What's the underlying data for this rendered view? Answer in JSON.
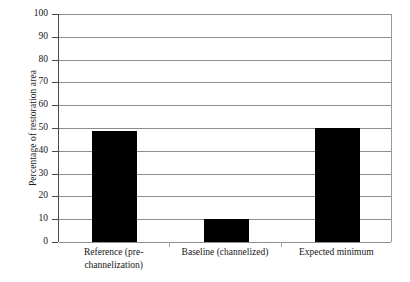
{
  "chart_data": {
    "type": "bar",
    "title": "",
    "xlabel": "",
    "ylabel": "Percentage of restoration area",
    "categories": [
      "Reference (pre-channelization)",
      "Baseline (channelized)",
      "Expected minimum"
    ],
    "category_lines": [
      [
        "Reference (pre-",
        "channelization)"
      ],
      [
        "Baseline (channelized)"
      ],
      [
        "Expected minimum"
      ]
    ],
    "values": [
      48.5,
      10,
      50
    ],
    "ylim": [
      0,
      100
    ],
    "yticks": [
      100,
      90,
      80,
      70,
      60,
      50,
      40,
      30,
      20,
      10,
      0
    ],
    "ytick_labels": [
      "100",
      "90",
      "80",
      "70",
      "60",
      "50",
      "40",
      "30",
      "20",
      "10",
      "0"
    ],
    "grid": true,
    "legend": null,
    "bar_color": "#000000",
    "gridline_color": "#8d8d8d",
    "axis_color": "#4a4a4a",
    "background_color": "#ffffff"
  }
}
